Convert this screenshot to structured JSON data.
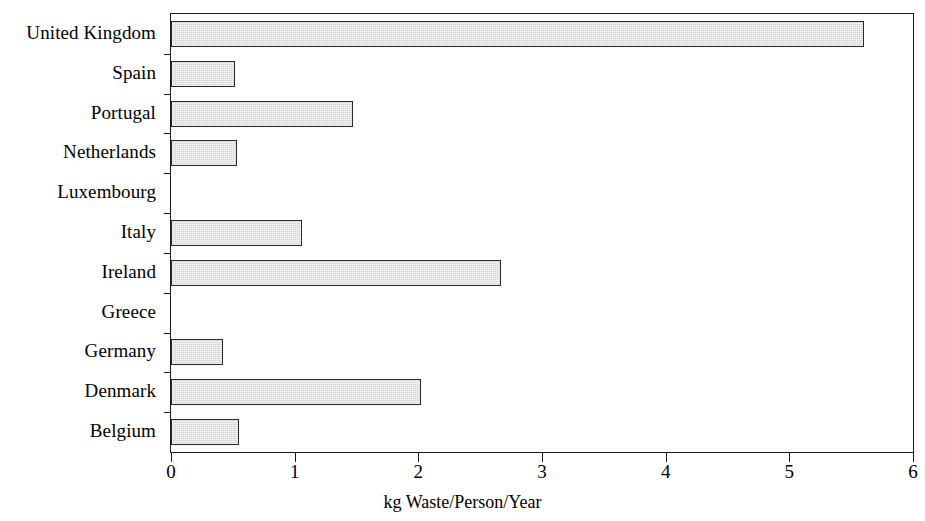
{
  "chart_data": {
    "type": "bar",
    "orientation": "horizontal",
    "title": "",
    "subtitle": "",
    "xlabel": "kg Waste/Person/Year",
    "ylabel": "",
    "xlim": [
      0,
      6
    ],
    "xticks": [
      0,
      1,
      2,
      3,
      4,
      5,
      6
    ],
    "xtick_labels": [
      "0",
      "1",
      "2",
      "3",
      "4",
      "5",
      "6"
    ],
    "grid": false,
    "legend": null,
    "legend_position": "none",
    "bar_fill_color": "#d2d2d2",
    "bar_edge_color": "#2a2a2a",
    "axis_color": "#1a1a1a",
    "background_color": "#ffffff",
    "categories": [
      "United Kingdom",
      "Spain",
      "Portugal",
      "Netherlands",
      "Luxembourg",
      "Italy",
      "Ireland",
      "Greece",
      "Germany",
      "Denmark",
      "Belgium"
    ],
    "values": [
      5.6,
      0.52,
      1.47,
      0.53,
      0.0,
      1.06,
      2.67,
      0.0,
      0.42,
      2.02,
      0.55
    ]
  }
}
